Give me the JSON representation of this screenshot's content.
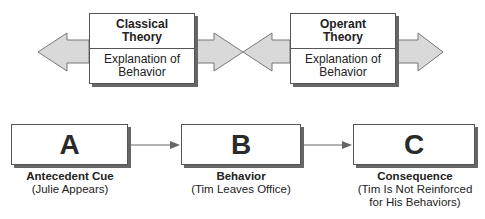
{
  "top_row": {
    "boxes": [
      {
        "title": "Classical Theory",
        "title_lines": [
          "Classical",
          "Theory"
        ],
        "subtitle_lines": [
          "Explanation of",
          "Behavior"
        ]
      },
      {
        "title": "Operant Theory",
        "title_lines": [
          "Operant",
          "Theory"
        ],
        "subtitle_lines": [
          "Explanation of",
          "Behavior"
        ]
      }
    ],
    "arrow_fill": "#d9d9d9",
    "arrow_stroke": "#777777"
  },
  "abc_row": {
    "steps": [
      {
        "letter": "A",
        "title": "Antecedent Cue",
        "desc_lines": [
          "(Julie Appears)"
        ]
      },
      {
        "letter": "B",
        "title": "Behavior",
        "desc_lines": [
          "(Tim Leaves Office)"
        ]
      },
      {
        "letter": "C",
        "title": "Consequence",
        "desc_lines": [
          "(Tim Is Not Reinforced",
          "for His Behaviors)"
        ]
      }
    ],
    "connector_color": "#666666"
  }
}
